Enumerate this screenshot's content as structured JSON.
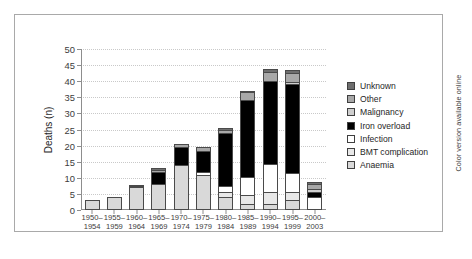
{
  "figure": {
    "side_note": "Color version available online"
  },
  "chart_data": {
    "type": "bar",
    "subtype": "stacked-vertical",
    "title": "",
    "xlabel": "",
    "ylabel": "Deaths (n)",
    "ylim": [
      0,
      50
    ],
    "yticks": [
      0,
      5,
      10,
      15,
      20,
      25,
      30,
      35,
      40,
      45,
      50
    ],
    "grid": "horizontal-dotted",
    "legend_position": "right",
    "categories": [
      "1950–\n1954",
      "1955–\n1959",
      "1960–\n1964",
      "1965–\n1969",
      "1970–\n1974",
      "1975–\n1979",
      "1980–\n1984",
      "1985–\n1989",
      "1990–\n1994",
      "1995–\n1999",
      "2000–\n2003"
    ],
    "category_labels": [
      {
        "top": "1950–",
        "bottom": "1954"
      },
      {
        "top": "1955–",
        "bottom": "1959"
      },
      {
        "top": "1960–",
        "bottom": "1964"
      },
      {
        "top": "1965–",
        "bottom": "1969"
      },
      {
        "top": "1970–",
        "bottom": "1974"
      },
      {
        "top": "1975–",
        "bottom": "1979"
      },
      {
        "top": "1980–",
        "bottom": "1984"
      },
      {
        "top": "1985–",
        "bottom": "1989"
      },
      {
        "top": "1990–",
        "bottom": "1994"
      },
      {
        "top": "1995–",
        "bottom": "1999"
      },
      {
        "top": "2000–",
        "bottom": "2003"
      }
    ],
    "stack_order_bottom_to_top": [
      "Anaemia",
      "BMT complication",
      "Infection",
      "Iron overload",
      "Malignancy",
      "Other",
      "Unknown"
    ],
    "series": [
      {
        "name": "Anaemia",
        "color": "#d9d9d9",
        "values": [
          3,
          4,
          7,
          8,
          14,
          11,
          4,
          2,
          2,
          3,
          0
        ]
      },
      {
        "name": "BMT complication",
        "color": "#e8e8e8",
        "values": [
          0,
          0,
          0,
          0,
          0,
          0,
          2,
          3,
          4,
          3,
          0
        ]
      },
      {
        "name": "Infection",
        "color": "#ffffff",
        "values": [
          0,
          0,
          0,
          0,
          0,
          1,
          2,
          6,
          9,
          6,
          4
        ]
      },
      {
        "name": "Iron overload",
        "color": "#000000",
        "values": [
          0,
          0,
          0.6,
          4,
          6,
          7,
          17,
          24,
          26,
          28,
          2
        ]
      },
      {
        "name": "Malignancy",
        "color": "#cfcfcf",
        "values": [
          0,
          0,
          0,
          0,
          0,
          0,
          0,
          0,
          0,
          1,
          1
        ]
      },
      {
        "name": "Other",
        "color": "#a8a8a8",
        "values": [
          0,
          0,
          0.4,
          1,
          1,
          1.5,
          1,
          3,
          3,
          3,
          2
        ]
      },
      {
        "name": "Unknown",
        "color": "#6e6e6e",
        "values": [
          0,
          0,
          0,
          1,
          0,
          0,
          1,
          0.5,
          1.5,
          1.5,
          1
        ]
      }
    ],
    "totals": [
      3,
      4,
      8,
      14,
      21,
      20.5,
      27,
      38.5,
      45.5,
      45.5,
      10
    ]
  },
  "legend": {
    "items": [
      {
        "label": "Unknown",
        "color": "#6e6e6e"
      },
      {
        "label": "Other",
        "color": "#a8a8a8"
      },
      {
        "label": "Malignancy",
        "color": "#cfcfcf"
      },
      {
        "label": "Iron overload",
        "color": "#000000"
      },
      {
        "label": "Infection",
        "color": "#ffffff"
      },
      {
        "label": "BMT complication",
        "color": "#e8e8e8"
      },
      {
        "label": "Anaemia",
        "color": "#d9d9d9"
      }
    ]
  }
}
